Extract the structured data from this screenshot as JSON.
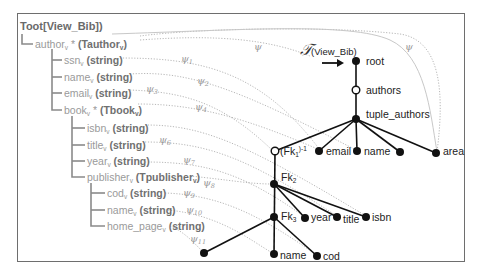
{
  "diagram": {
    "schema_tree": {
      "root_label": "Toot[View_Bib])",
      "items": [
        {
          "name": "author",
          "sub": "v",
          "suffix": " * ",
          "type": "(Tauthor",
          "type_sub": "v",
          "type_close": ")"
        },
        {
          "name": "ssn",
          "sub": "v",
          "type": "(string)"
        },
        {
          "name": "name",
          "sub": "v",
          "type": "(string)"
        },
        {
          "name": "email",
          "sub": "v",
          "type": "(string)"
        },
        {
          "name": "book",
          "sub": "v",
          "suffix": " * ",
          "type": "(Tbook",
          "type_sub": "v",
          "type_close": ")"
        },
        {
          "name": "isbn",
          "sub": "v",
          "type": "(string)"
        },
        {
          "name": "title",
          "sub": "v",
          "type": "(string)"
        },
        {
          "name": "year",
          "sub": "v",
          "type": "(string)"
        },
        {
          "name": "publisher",
          "sub": "v",
          "type": "(Tpublisher",
          "type_sub": "v",
          "type_close": ")"
        },
        {
          "name": "cod",
          "sub": "v",
          "type": "(string)"
        },
        {
          "name": "name",
          "sub": "v",
          "type": "(string)"
        },
        {
          "name": "home_page",
          "sub": "v",
          "type": "(string)"
        }
      ]
    },
    "mappings": [
      {
        "sym": "ψ",
        "sub": ""
      },
      {
        "sym": "ψ",
        "sub": ""
      },
      {
        "sym": "ψ",
        "sub": "1"
      },
      {
        "sym": "ψ",
        "sub": "2"
      },
      {
        "sym": "ψ",
        "sub": "3"
      },
      {
        "sym": "ψ",
        "sub": "4"
      },
      {
        "sym": "ψ",
        "sub": "6"
      },
      {
        "sym": "ψ",
        "sub": "7"
      },
      {
        "sym": "ψ",
        "sub": "8"
      },
      {
        "sym": "ψ",
        "sub": "9"
      },
      {
        "sym": "ψ",
        "sub": "10"
      },
      {
        "sym": "ψ",
        "sub": "11"
      }
    ],
    "graph": {
      "title_symbol": "𝒯",
      "title_sub": "(View_Bib)",
      "nodes": {
        "root": "root",
        "authors": "authors",
        "tuple_authors": "tuple_authors",
        "fk1": "(Fk",
        "fk1_sub": "1",
        "fk1_sup": ")-1",
        "email": "email",
        "name": "name",
        "area": "area",
        "fk2": "Fk",
        "fk2_sub": "2",
        "fk3": "Fk",
        "fk3_sub": "3",
        "year": "year",
        "title": "title",
        "isbn": "isbn",
        "name2": "name",
        "cod": "cod"
      }
    }
  }
}
